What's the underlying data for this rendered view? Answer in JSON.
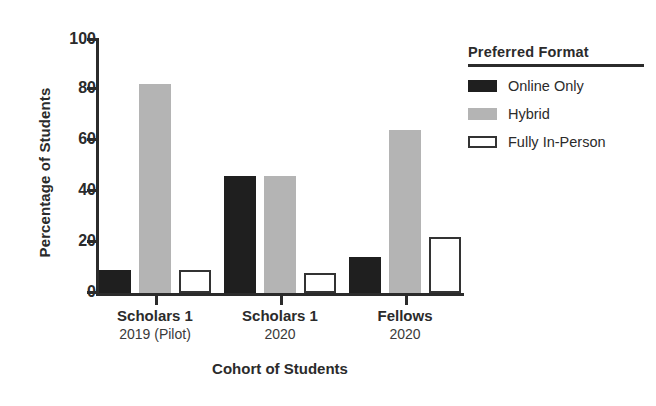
{
  "chart_data": {
    "type": "bar",
    "title": "",
    "xlabel": "Cohort of Students",
    "ylabel": "Percentage of Students",
    "ylim": [
      0,
      100
    ],
    "yticks": [
      0,
      20,
      40,
      60,
      80,
      100
    ],
    "grid": false,
    "legend_position": "right",
    "legend_title": "Preferred Format",
    "categories": [
      {
        "line1": "Scholars 1",
        "line2": "2019 (Pilot)"
      },
      {
        "line1": "Scholars 1",
        "line2": "2020"
      },
      {
        "line1": "Fellows",
        "line2": "2020"
      }
    ],
    "series": [
      {
        "name": "Online Only",
        "color": "#1f1f1f",
        "style": "filled",
        "values": [
          9,
          46,
          14
        ]
      },
      {
        "name": "Hybrid",
        "color": "#b4b4b4",
        "style": "filled",
        "values": [
          82,
          46,
          64
        ]
      },
      {
        "name": "Fully In-Person",
        "color": "#ffffff",
        "style": "outlined",
        "values": [
          9,
          8,
          22
        ]
      }
    ]
  },
  "axis": {
    "y_tick_labels": [
      "0",
      "20",
      "40",
      "60",
      "80",
      "100"
    ]
  }
}
